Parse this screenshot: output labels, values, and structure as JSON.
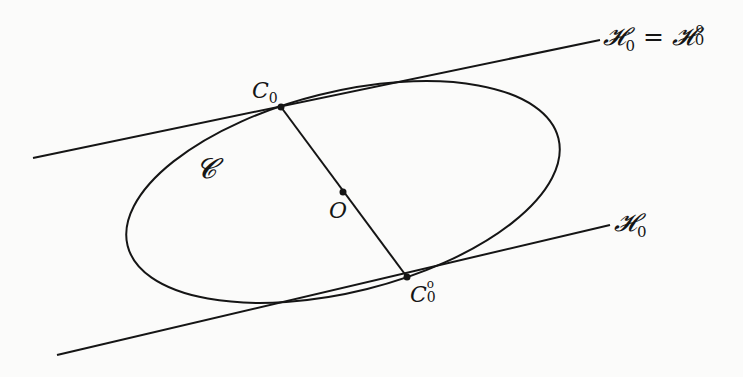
{
  "figure": {
    "background": "#fbfbfa",
    "stroke_color": "#151515",
    "elements": {
      "upper_tangent_line": {
        "x1": 33,
        "y1": 158,
        "x2": 600,
        "y2": 40
      },
      "lower_tangent_line": {
        "x1": 57,
        "y1": 355,
        "x2": 610,
        "y2": 225
      },
      "diameter_segment": {
        "x1": 281,
        "y1": 107,
        "x2": 407,
        "y2": 277
      },
      "ellipse": {
        "cx": 343,
        "cy": 192,
        "rx": 222,
        "ry": 100,
        "rotation_deg": -14
      },
      "points": [
        {
          "name": "C0",
          "x": 281,
          "y": 107
        },
        {
          "name": "O",
          "x": 343,
          "y": 192
        },
        {
          "name": "C0-circ",
          "x": 407,
          "y": 277
        }
      ]
    },
    "labels": {
      "upper_line": {
        "h": "𝓗",
        "sub": "0",
        "prime": "′",
        "eq": " = ",
        "h2": "𝓗",
        "sub2": "0",
        "sup2": "o"
      },
      "lower_line": {
        "h": "𝓗",
        "sub": "0"
      },
      "curve": "𝓒",
      "c0": {
        "main": "C",
        "sub": "0"
      },
      "c0_circ": {
        "main": "C",
        "sub": "0",
        "sup": "o"
      },
      "center": "O"
    }
  }
}
